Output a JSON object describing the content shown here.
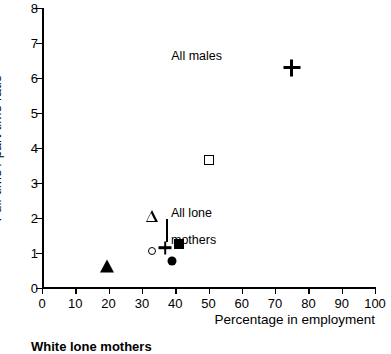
{
  "chart_data": {
    "type": "scatter",
    "title": "",
    "xlabel": "Percentage in employment",
    "ylabel": "Full-time / part-time ratio",
    "xlim": [
      0,
      100
    ],
    "ylim": [
      0,
      8
    ],
    "xticks": [
      0,
      10,
      20,
      30,
      40,
      50,
      60,
      70,
      80,
      90,
      100
    ],
    "yticks": [
      0,
      1,
      2,
      3,
      4,
      5,
      6,
      7,
      8
    ],
    "grid": false,
    "legend_position": "below-plot",
    "points": [
      {
        "marker": "plus",
        "x": 75.0,
        "y": 6.3,
        "label": "All males"
      },
      {
        "marker": "square-open",
        "x": 50.0,
        "y": 3.65,
        "label": ""
      },
      {
        "marker": "triangle-open",
        "x": 33.0,
        "y": 2.05,
        "label": ""
      },
      {
        "marker": "square-filled",
        "x": 41.0,
        "y": 1.25,
        "label": ""
      },
      {
        "marker": "plus",
        "x": 37.0,
        "y": 1.15,
        "label": "All lone mothers"
      },
      {
        "marker": "circle-open",
        "x": 33.0,
        "y": 1.05,
        "label": ""
      },
      {
        "marker": "circle-filled",
        "x": 39.0,
        "y": 0.78,
        "label": ""
      },
      {
        "marker": "triangle-filled",
        "x": 19.5,
        "y": 0.62,
        "label": ""
      }
    ],
    "annotations": [
      {
        "text": "All males",
        "x": 75.0,
        "y": 6.3
      },
      {
        "text": "All lone mothers",
        "x": 37.0,
        "y": 1.15
      }
    ]
  },
  "axes": {
    "ylabel": "Full-time / part-time ratio",
    "xlabel": "Percentage in employment",
    "xticklabels": [
      "0",
      "10",
      "20",
      "30",
      "40",
      "50",
      "60",
      "70",
      "80",
      "90",
      "100"
    ],
    "yticklabels": [
      "0",
      "1",
      "2",
      "3",
      "4",
      "5",
      "6",
      "7",
      "8"
    ]
  },
  "annotations": {
    "all_males": "All males",
    "all_lone_mothers_line1": "All lone",
    "all_lone_mothers_line2": "mothers"
  },
  "legend": {
    "entry_1": "White lone mothers"
  },
  "colors": {
    "foreground": "#000000",
    "background": "#ffffff"
  }
}
